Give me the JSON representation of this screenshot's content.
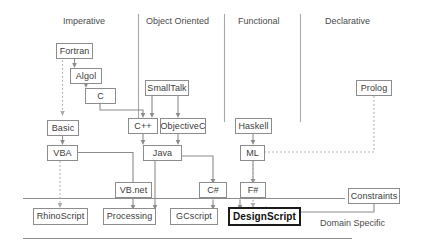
{
  "diagram": {
    "columns": [
      {
        "id": "imperative",
        "label": "Imperative"
      },
      {
        "id": "object-oriented",
        "label": "Object Oriented"
      },
      {
        "id": "functional",
        "label": "Functional"
      },
      {
        "id": "declarative",
        "label": "Declarative"
      }
    ],
    "nodes": [
      {
        "id": "fortran",
        "label": "Fortran"
      },
      {
        "id": "algol",
        "label": "Algol"
      },
      {
        "id": "c",
        "label": "C"
      },
      {
        "id": "basic",
        "label": "Basic"
      },
      {
        "id": "vba",
        "label": "VBA"
      },
      {
        "id": "smalltalk",
        "label": "SmallTalk"
      },
      {
        "id": "cpp",
        "label": "C++"
      },
      {
        "id": "objectivec",
        "label": "ObjectiveC"
      },
      {
        "id": "java",
        "label": "Java"
      },
      {
        "id": "vbnet",
        "label": "VB.net"
      },
      {
        "id": "csharp",
        "label": "C#"
      },
      {
        "id": "haskell",
        "label": "Haskell"
      },
      {
        "id": "ml",
        "label": "ML"
      },
      {
        "id": "fsharp",
        "label": "F#"
      },
      {
        "id": "prolog",
        "label": "Prolog"
      },
      {
        "id": "constraints",
        "label": "Constraints"
      },
      {
        "id": "rhinoscript",
        "label": "RhinoScript"
      },
      {
        "id": "processing",
        "label": "Processing"
      },
      {
        "id": "gcscript",
        "label": "GCscript"
      },
      {
        "id": "designscript",
        "label": "DesignScript"
      }
    ],
    "annotations": [
      {
        "id": "domain-specific",
        "label": "Domain Specific"
      }
    ],
    "colors": {
      "box_border": "#8c8c8c",
      "box_fill": "#ffffff",
      "text": "#3b3b3b",
      "emphasis_border": "#1b1b1b",
      "connector": "#8c8c8c",
      "dotted_connector": "#b0b0b0",
      "divider": "#a8a8a8"
    }
  }
}
